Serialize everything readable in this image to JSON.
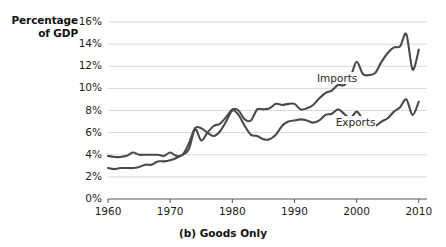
{
  "chart_data": {
    "type": "line",
    "title": "",
    "caption": "(b) Goods Only",
    "ylabel_line1": "Percentage",
    "ylabel_line2": "of GDP",
    "xlabel": "",
    "grid": true,
    "legend_position": "inline-annotation",
    "xlim": [
      1960,
      2011
    ],
    "ylim": [
      0,
      16
    ],
    "yticks": [
      "0%",
      "2%",
      "4%",
      "6%",
      "8%",
      "10%",
      "12%",
      "14%",
      "16%"
    ],
    "ytick_values": [
      0,
      2,
      4,
      6,
      8,
      10,
      12,
      14,
      16
    ],
    "xticks": [
      "1960",
      "1970",
      "1980",
      "1990",
      "2000",
      "2010"
    ],
    "xtick_values": [
      1960,
      1970,
      1980,
      1990,
      2000,
      2010
    ],
    "line_color": "#4a4a4a",
    "grid_color": "#d8d8d8",
    "axis_color": "#555555",
    "series": [
      {
        "name": "Imports",
        "label_x": 1997,
        "label_y": 10.9,
        "x": [
          1960,
          1961,
          1962,
          1963,
          1964,
          1965,
          1966,
          1967,
          1968,
          1969,
          1970,
          1971,
          1972,
          1973,
          1974,
          1975,
          1976,
          1977,
          1978,
          1979,
          1980,
          1981,
          1982,
          1983,
          1984,
          1985,
          1986,
          1987,
          1988,
          1989,
          1990,
          1991,
          1992,
          1993,
          1994,
          1995,
          1996,
          1997,
          1998,
          1999,
          2000,
          2001,
          2002,
          2003,
          2004,
          2005,
          2006,
          2007,
          2008,
          2009,
          2010
        ],
        "values": [
          2.8,
          2.7,
          2.8,
          2.8,
          2.8,
          2.9,
          3.1,
          3.1,
          3.4,
          3.4,
          3.5,
          3.7,
          4.0,
          4.5,
          6.3,
          5.3,
          6.0,
          6.6,
          6.8,
          7.4,
          8.1,
          8.0,
          7.2,
          7.1,
          8.1,
          8.1,
          8.2,
          8.6,
          8.5,
          8.6,
          8.6,
          8.1,
          8.2,
          8.5,
          9.1,
          9.6,
          9.8,
          10.3,
          10.3,
          11.0,
          12.4,
          11.3,
          11.2,
          11.4,
          12.4,
          13.2,
          13.7,
          13.8,
          14.9,
          11.7,
          13.5
        ]
      },
      {
        "name": "Exports",
        "label_x": 2000,
        "label_y": 7.0,
        "x": [
          1960,
          1961,
          1962,
          1963,
          1964,
          1965,
          1966,
          1967,
          1968,
          1969,
          1970,
          1971,
          1972,
          1973,
          1974,
          1975,
          1976,
          1977,
          1978,
          1979,
          1980,
          1981,
          1982,
          1983,
          1984,
          1985,
          1986,
          1987,
          1988,
          1989,
          1990,
          1991,
          1992,
          1993,
          1994,
          1995,
          1996,
          1997,
          1998,
          1999,
          2000,
          2001,
          2002,
          2003,
          2004,
          2005,
          2006,
          2007,
          2008,
          2009,
          2010
        ],
        "values": [
          3.9,
          3.8,
          3.8,
          3.9,
          4.2,
          4.0,
          4.0,
          4.0,
          4.0,
          3.9,
          4.2,
          3.9,
          4.0,
          5.0,
          6.4,
          6.4,
          6.0,
          5.7,
          6.1,
          7.0,
          8.0,
          7.6,
          6.6,
          5.8,
          5.7,
          5.4,
          5.4,
          5.8,
          6.6,
          7.0,
          7.1,
          7.2,
          7.1,
          6.9,
          7.1,
          7.6,
          7.7,
          8.1,
          7.7,
          7.3,
          7.9,
          7.2,
          6.6,
          6.6,
          7.0,
          7.3,
          7.9,
          8.3,
          9.0,
          7.6,
          8.8
        ]
      }
    ]
  }
}
